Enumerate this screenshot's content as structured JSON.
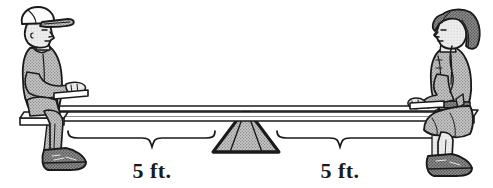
{
  "figure": {
    "name": "seesaw-balance-diagram",
    "background_color": "#ffffff",
    "outline_color": "#1a1a1a",
    "fill_gray": "#a8a8a8",
    "fill_light": "#f2f2f2",
    "fill_dark": "#5a5a5a"
  },
  "measurements": [
    {
      "id": "left-distance",
      "label": "5 ft.",
      "value": 5,
      "unit": "ft.",
      "side": "left",
      "from": "fulcrum",
      "to": "boy"
    },
    {
      "id": "right-distance",
      "label": "5 ft.",
      "value": 5,
      "unit": "ft.",
      "side": "right",
      "from": "fulcrum",
      "to": "girl"
    }
  ],
  "figures": [
    {
      "id": "boy",
      "label": "boy-on-seesaw",
      "side": "left",
      "facing": "right",
      "wears": "baseball cap"
    },
    {
      "id": "girl",
      "label": "girl-on-seesaw",
      "side": "right",
      "facing": "left",
      "wears": "dress"
    }
  ],
  "parts": {
    "plank": "seesaw-plank",
    "fulcrum": "triangular-fulcrum",
    "left_brace": "left-measurement-brace",
    "right_brace": "right-measurement-brace"
  }
}
